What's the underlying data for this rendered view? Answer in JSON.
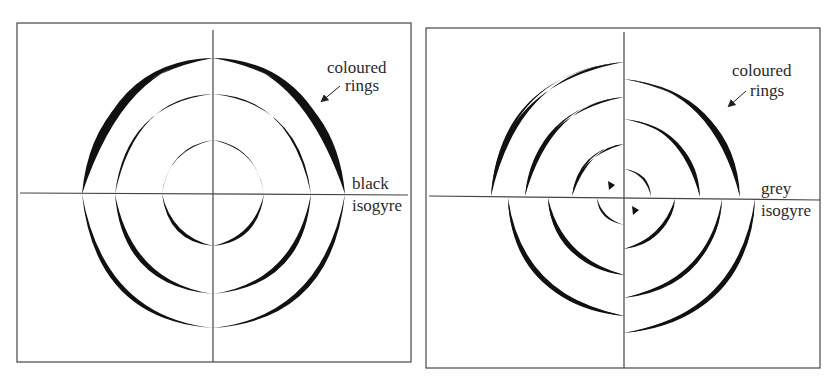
{
  "figure": {
    "panels": [
      {
        "id": "left",
        "frame": {
          "x": 17,
          "y": 23,
          "w": 394,
          "h": 339
        },
        "center": {
          "x": 213,
          "y": 194
        },
        "ring_radii": [
          51,
          98,
          131
        ],
        "labels": {
          "rings_line1": "coloured",
          "rings_line2": "rings",
          "isogyre_line1": "black",
          "isogyre_line2": "isogyre"
        }
      },
      {
        "id": "right",
        "frame": {
          "x": 426,
          "y": 28,
          "w": 394,
          "h": 340
        },
        "center": {
          "x": 624,
          "y": 198
        },
        "labels": {
          "rings_line1": "coloured",
          "rings_line2": "rings",
          "isogyre_line1": "grey",
          "isogyre_line2": "isogyre"
        }
      }
    ],
    "colors": {
      "ink": "#111111",
      "frame": "#555555",
      "background": "#ffffff"
    }
  }
}
